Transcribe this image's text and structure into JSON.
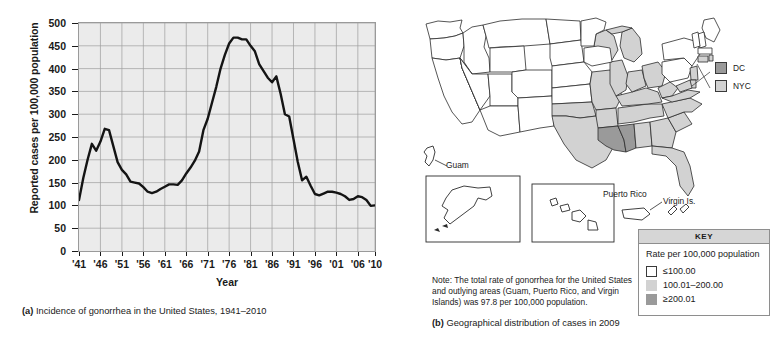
{
  "figure": {
    "panel_a_caption_marker": "(a)",
    "panel_a_caption": "Incidence of gonorrhea in the United States, 1941–2010",
    "panel_b_caption_marker": "(b)",
    "panel_b_caption": "Geographical distribution of cases in 2009"
  },
  "chart_data": {
    "type": "line",
    "title": "",
    "xlabel": "Year",
    "ylabel": "Reported cases per 100,000 population",
    "xlim": [
      1941,
      2010
    ],
    "ylim": [
      0,
      500
    ],
    "yticks": [
      0,
      50,
      100,
      150,
      200,
      250,
      300,
      350,
      400,
      450,
      500
    ],
    "ytick_labels": [
      "0",
      "50",
      "100",
      "150",
      "200",
      "250",
      "300",
      "350",
      "400",
      "450",
      "500"
    ],
    "xticks": [
      1941,
      1946,
      1951,
      1956,
      1961,
      1966,
      1971,
      1976,
      1981,
      1986,
      1991,
      1996,
      2001,
      2006,
      2010
    ],
    "xtick_labels": [
      "'41",
      "'46",
      "'51",
      "'56",
      "'61",
      "'66",
      "'71",
      "'76",
      "'81",
      "'86",
      "'91",
      "'96",
      "'01",
      "'06",
      "'10"
    ],
    "grid": true,
    "legend": "none",
    "series": [
      {
        "name": "Reported gonorrhea cases per 100,000 population",
        "x": [
          1941,
          1942,
          1943,
          1944,
          1945,
          1946,
          1947,
          1948,
          1949,
          1950,
          1951,
          1952,
          1953,
          1954,
          1955,
          1956,
          1957,
          1958,
          1959,
          1960,
          1961,
          1962,
          1963,
          1964,
          1965,
          1966,
          1967,
          1968,
          1969,
          1970,
          1971,
          1972,
          1973,
          1974,
          1975,
          1976,
          1977,
          1978,
          1979,
          1980,
          1981,
          1982,
          1983,
          1984,
          1985,
          1986,
          1987,
          1988,
          1989,
          1990,
          1991,
          1992,
          1993,
          1994,
          1995,
          1996,
          1997,
          1998,
          1999,
          2000,
          2001,
          2002,
          2003,
          2004,
          2005,
          2006,
          2007,
          2008,
          2009,
          2010
        ],
        "y": [
          112,
          160,
          200,
          235,
          220,
          240,
          268,
          265,
          230,
          195,
          178,
          168,
          152,
          150,
          148,
          140,
          130,
          127,
          130,
          136,
          141,
          146,
          146,
          145,
          155,
          170,
          183,
          198,
          218,
          265,
          290,
          325,
          360,
          400,
          430,
          455,
          468,
          468,
          464,
          464,
          450,
          438,
          410,
          395,
          380,
          370,
          383,
          345,
          300,
          295,
          245,
          195,
          155,
          163,
          143,
          125,
          122,
          126,
          130,
          130,
          128,
          125,
          120,
          112,
          114,
          120,
          118,
          112,
          99,
          100
        ]
      }
    ]
  },
  "map": {
    "labels": {
      "guam": "Guam",
      "puerto_rico": "Puerto Rico",
      "virgin_is": "Virgin Is."
    },
    "inline_legend": [
      {
        "label": "DC",
        "color": "#9a9a9a"
      },
      {
        "label": "NYC",
        "color": "#d2d2d2"
      }
    ],
    "key": {
      "header": "KEY",
      "title": "Rate per 100,000 population",
      "items": [
        {
          "label": "≤100.00",
          "color": "#ffffff"
        },
        {
          "label": "100.01–200.00",
          "color": "#d2d2d2"
        },
        {
          "label": "≥200.01",
          "color": "#9a9a9a"
        }
      ]
    },
    "note": "Note: The total rate of gonorrhea for the United States and outlying areas (Guam, Puerto Rico, and Virgin Islands) was 97.8 per 100,000 population.",
    "colors": {
      "low": "#ffffff",
      "mid": "#d2d2d2",
      "high": "#9a9a9a",
      "outline": "#2b2b2b"
    }
  }
}
